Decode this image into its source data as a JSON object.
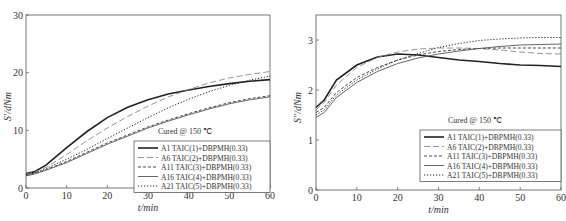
{
  "chart_data": [
    {
      "type": "line",
      "title": "",
      "xlabel": "t/min",
      "ylabel": "S'/dNm",
      "xlim": [
        0,
        60
      ],
      "ylim": [
        0,
        30
      ],
      "xticks": [
        0,
        10,
        20,
        30,
        40,
        50,
        60
      ],
      "yticks": [
        0,
        10,
        20,
        30
      ],
      "annotation": "Cured @ 150 ℃",
      "legend_position": "lower right",
      "x": [
        0,
        2,
        5,
        10,
        15,
        20,
        25,
        30,
        35,
        40,
        45,
        50,
        55,
        60
      ],
      "series": [
        {
          "name": "A1 TAIC(1)+DBPMH(0.33)",
          "style": "solid-thick",
          "values": [
            2.5,
            2.8,
            4.0,
            7.0,
            9.8,
            12.2,
            14.0,
            15.3,
            16.3,
            17.0,
            17.6,
            18.1,
            18.5,
            18.8
          ]
        },
        {
          "name": "A6 TAIC(2)+DBPMH(0.33)",
          "style": "long-dash",
          "values": [
            2.4,
            2.7,
            3.6,
            5.8,
            8.2,
            10.4,
            12.4,
            14.2,
            15.8,
            17.1,
            18.2,
            19.1,
            19.7,
            20.2
          ]
        },
        {
          "name": "A11 TAIC(3)+DBPMH(0.33)",
          "style": "dash",
          "values": [
            2.2,
            2.5,
            3.2,
            4.6,
            6.2,
            7.8,
            9.2,
            10.6,
            11.8,
            12.9,
            13.9,
            14.8,
            15.5,
            16.0
          ]
        },
        {
          "name": "A16 TAIC(4)+DBPMH(0.33)",
          "style": "solid-thin",
          "values": [
            2.1,
            2.4,
            3.1,
            4.4,
            6.0,
            7.6,
            9.0,
            10.4,
            11.6,
            12.7,
            13.7,
            14.6,
            15.3,
            15.8
          ]
        },
        {
          "name": "A21 TAIC(5)+DBPMH(0.33)",
          "style": "dot",
          "values": [
            2.3,
            2.6,
            3.4,
            5.0,
            6.7,
            8.6,
            10.4,
            12.2,
            13.9,
            15.4,
            16.7,
            17.8,
            18.7,
            19.4
          ]
        }
      ]
    },
    {
      "type": "line",
      "title": "",
      "xlabel": "t/min",
      "ylabel": "S''/dNm",
      "xlim": [
        0,
        60
      ],
      "ylim": [
        0,
        3.5
      ],
      "xticks": [
        0,
        10,
        20,
        30,
        40,
        50,
        60
      ],
      "yticks": [
        0,
        1,
        2,
        3
      ],
      "annotation": "Cured @ 150 ℃",
      "legend_position": "lower right",
      "x": [
        0,
        2,
        5,
        10,
        15,
        20,
        25,
        30,
        35,
        40,
        45,
        50,
        55,
        60
      ],
      "series": [
        {
          "name": "A1 TAIC(1)+DBPMH(0.33)",
          "style": "solid-thick",
          "values": [
            1.65,
            1.8,
            2.2,
            2.5,
            2.66,
            2.72,
            2.7,
            2.65,
            2.6,
            2.57,
            2.53,
            2.5,
            2.49,
            2.47
          ]
        },
        {
          "name": "A6 TAIC(2)+DBPMH(0.33)",
          "style": "long-dash",
          "values": [
            1.6,
            1.75,
            2.1,
            2.45,
            2.65,
            2.76,
            2.82,
            2.84,
            2.84,
            2.83,
            2.8,
            2.76,
            2.73,
            2.72
          ]
        },
        {
          "name": "A11 TAIC(3)+DBPMH(0.33)",
          "style": "dash",
          "values": [
            1.55,
            1.65,
            1.95,
            2.25,
            2.45,
            2.6,
            2.7,
            2.77,
            2.81,
            2.83,
            2.84,
            2.84,
            2.84,
            2.84
          ]
        },
        {
          "name": "A16 TAIC(4)+DBPMH(0.33)",
          "style": "solid-thin",
          "values": [
            1.45,
            1.55,
            1.85,
            2.15,
            2.37,
            2.53,
            2.64,
            2.72,
            2.78,
            2.83,
            2.87,
            2.9,
            2.91,
            2.92
          ]
        },
        {
          "name": "A21 TAIC(5)+DBPMH(0.33)",
          "style": "dot",
          "values": [
            1.5,
            1.6,
            1.9,
            2.2,
            2.42,
            2.6,
            2.73,
            2.85,
            2.93,
            2.99,
            3.02,
            3.04,
            3.05,
            3.05
          ]
        }
      ]
    }
  ]
}
